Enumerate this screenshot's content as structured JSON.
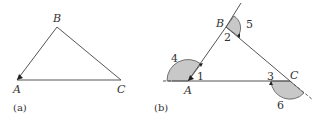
{
  "panel_a": {
    "caption": "(a)",
    "vertices": {
      "A": "A",
      "B": "B",
      "C": "C"
    }
  },
  "panel_b": {
    "caption": "(b)",
    "vertices": {
      "A": "A",
      "B": "B",
      "C": "C"
    },
    "interior_angles": [
      "1",
      "2",
      "3"
    ],
    "exterior_angles": [
      "4",
      "5",
      "6"
    ]
  },
  "colors": {
    "line": "#555555",
    "shade": "#c8c8c8",
    "text": "#333333"
  }
}
